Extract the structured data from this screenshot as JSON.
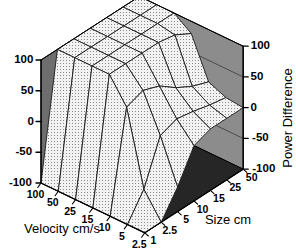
{
  "chart_data": {
    "type": "surface",
    "title": "",
    "xlabel": "Velocity cm/s",
    "ylabel": "Size cm",
    "zlabel": "Power Difference",
    "grid": true,
    "legend": "none",
    "projection": "3d-wireframe-surface",
    "x_categories": [
      "100",
      "50",
      "25",
      "15",
      "10",
      "5",
      "2.5"
    ],
    "y_categories": [
      "1",
      "2.5",
      "5",
      "10",
      "15",
      "25",
      "50"
    ],
    "zlim": [
      -100,
      100
    ],
    "z_ticks_left": [
      "100",
      "50",
      "0",
      "-50",
      "-100"
    ],
    "z_ticks_right": [
      "100",
      "50",
      "0",
      "-50",
      "-100"
    ],
    "z_tick_values": [
      100,
      50,
      0,
      -50,
      -100
    ],
    "series": [
      {
        "name": "Velocity 100",
        "values": [
          -100,
          100,
          100,
          100,
          100,
          100,
          100
        ]
      },
      {
        "name": "Velocity 50",
        "values": [
          -100,
          100,
          100,
          100,
          100,
          100,
          100
        ]
      },
      {
        "name": "Velocity 25",
        "values": [
          -100,
          100,
          100,
          100,
          100,
          100,
          100
        ]
      },
      {
        "name": "Velocity 15",
        "values": [
          -100,
          100,
          100,
          100,
          100,
          95,
          80
        ]
      },
      {
        "name": "Velocity 10",
        "values": [
          -100,
          60,
          70,
          60,
          40,
          25,
          15
        ]
      },
      {
        "name": "Velocity 5",
        "values": [
          -100,
          -60,
          10,
          20,
          15,
          8,
          3
        ]
      },
      {
        "name": "Velocity 2.5",
        "values": [
          -100,
          -100,
          -60,
          -10,
          0,
          0,
          0
        ]
      }
    ]
  },
  "axes": {
    "left_axis": {
      "name": "power-difference-left",
      "ticks": [
        "100",
        "50",
        "0",
        "-50",
        "-100"
      ]
    },
    "right_axis": {
      "name": "power-difference-right",
      "title": "Power Difference",
      "ticks": [
        "100",
        "50",
        "0",
        "-50",
        "-100"
      ]
    },
    "velocity_axis": {
      "title": "Velocity cm/s",
      "ticks": [
        "100",
        "50",
        "25",
        "15",
        "10",
        "5",
        "2.5"
      ]
    },
    "size_axis": {
      "title": "Size cm",
      "ticks": [
        "1",
        "2.5",
        "5",
        "10",
        "15",
        "25",
        "50"
      ]
    }
  },
  "colors": {
    "surface_fill": "#e8e8e8",
    "surface_line": "#1a1a1a",
    "wall_back_right": "#8c8c8c",
    "wall_back_left": "#6e6e6e",
    "wall_left_dark": "#5c5c5c",
    "floor": "#262626",
    "floor_mid": "#3d3d3d",
    "axis_line": "#000000",
    "background": "#ffffff"
  }
}
